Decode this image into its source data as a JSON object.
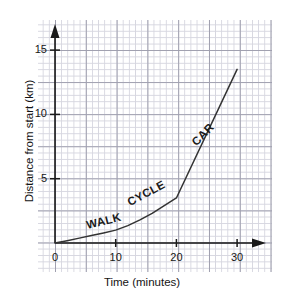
{
  "chart_data": {
    "type": "line",
    "title": "",
    "xlabel": "Time (minutes)",
    "ylabel": "Distance from start (km)",
    "xlim": [
      0,
      33
    ],
    "ylim": [
      0,
      16.5
    ],
    "xticks": [
      0,
      10,
      20,
      30
    ],
    "yticks": [
      5,
      10,
      15
    ],
    "grid": true,
    "legend": "none",
    "axis_arrows": true,
    "series": [
      {
        "name": "journey",
        "x": [
          0,
          2,
          4,
          6,
          8,
          10,
          12,
          14,
          16,
          18,
          20,
          30
        ],
        "values": [
          0,
          0.18,
          0.38,
          0.58,
          0.78,
          1.0,
          1.35,
          1.8,
          2.3,
          2.9,
          3.5,
          13.5
        ]
      }
    ],
    "annotations": [
      {
        "text": "WALK",
        "x": 5.5,
        "y": 0.95,
        "rotation": -14
      },
      {
        "text": "CYCLE",
        "x": 12.5,
        "y": 2.75,
        "rotation": -28
      },
      {
        "text": "CAR",
        "x": 23.5,
        "y": 7.4,
        "rotation": -46
      }
    ],
    "segments": [
      {
        "label": "WALK",
        "from_minutes": 0,
        "to_minutes": 10,
        "from_km": 0,
        "to_km": 1.0
      },
      {
        "label": "CYCLE",
        "from_minutes": 10,
        "to_minutes": 20,
        "from_km": 1.0,
        "to_km": 3.5
      },
      {
        "label": "CAR",
        "from_minutes": 20,
        "to_minutes": 30,
        "from_km": 3.5,
        "to_km": 13.5
      }
    ]
  },
  "axis": {
    "x_title": "Time (minutes)",
    "y_title": "Distance from start (km)",
    "x_tick_labels": [
      "0",
      "10",
      "20",
      "30"
    ],
    "y_tick_labels": [
      "5",
      "10",
      "15"
    ]
  },
  "labels": {
    "walk": "WALK",
    "cycle": "CYCLE",
    "car": "CAR"
  },
  "colors": {
    "line": "#333333",
    "axis": "#1a1a1a",
    "grid_minor": "#d4d4de",
    "grid_major": "#9b9bab",
    "background": "#ffffff",
    "text": "#141414"
  }
}
